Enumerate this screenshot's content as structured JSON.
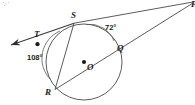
{
  "figure": {
    "background_color": "#ffffff",
    "stroke_color": "#3a3a3a",
    "label_color": "#1b1b1b"
  },
  "points": {
    "T": {
      "label": "T",
      "x": 37,
      "y": 38,
      "dot": true
    },
    "S": {
      "label": "S",
      "x": 74,
      "y": 23,
      "dot": false
    },
    "Q": {
      "label": "Q",
      "x": 118,
      "y": 44,
      "dot": false
    },
    "O": {
      "label": "O",
      "x": 84,
      "y": 62,
      "dot": true
    },
    "R": {
      "label": "R",
      "x": 55,
      "y": 90,
      "dot": false
    },
    "P": {
      "label": "P",
      "x": 192,
      "y": 3,
      "dot": false
    }
  },
  "circle": {
    "center_x": 84,
    "center_y": 62,
    "radius": 38
  },
  "angles": [
    {
      "id": "arc-72",
      "label": "72°",
      "value": 72,
      "x": 108,
      "y": 27
    },
    {
      "id": "arc-108",
      "label": "108°",
      "value": 108,
      "x": 32,
      "y": 57
    }
  ],
  "lines": {
    "tangent": {
      "from": "P",
      "through": [
        "S",
        "T"
      ],
      "arrow_end": "left"
    },
    "secant": {
      "from": "P",
      "through": [
        "Q",
        "O",
        "R"
      ]
    },
    "chord": {
      "from": "S",
      "to": "R"
    }
  }
}
